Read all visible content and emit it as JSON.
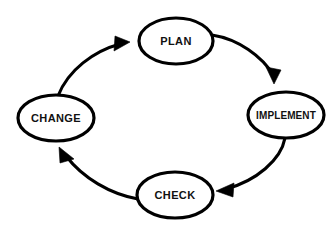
{
  "diagram": {
    "background_color": "#ffffff",
    "stroke_color": "#000000",
    "text_color": "#111111",
    "nodes": [
      {
        "id": "plan",
        "label": "PLAN",
        "icon": "ellipse-node",
        "cx": 176,
        "cy": 41,
        "rx": 37,
        "ry": 23
      },
      {
        "id": "implement",
        "label": "IMPLEMENT",
        "icon": "ellipse-node",
        "cx": 286,
        "cy": 115,
        "rx": 38,
        "ry": 23
      },
      {
        "id": "check",
        "label": "CHECK",
        "icon": "ellipse-node",
        "cx": 175,
        "cy": 195,
        "rx": 38,
        "ry": 23
      },
      {
        "id": "change",
        "label": "CHANGE",
        "icon": "ellipse-node",
        "cx": 56,
        "cy": 118,
        "rx": 38,
        "ry": 23
      }
    ],
    "edges": [
      {
        "id": "plan-to-implement",
        "from": "plan",
        "to": "implement",
        "icon": "curved-arrow-icon",
        "path": "M 212 35 C 238 39 262 56 274 76",
        "arrow_points": "274,84 266,67 281,70"
      },
      {
        "id": "implement-to-check",
        "from": "implement",
        "to": "check",
        "icon": "curved-arrow-icon",
        "path": "M 285 138 C 281 160 256 181 226 189",
        "arrow_points": "216,191 234,183 233,197"
      },
      {
        "id": "check-to-change",
        "from": "check",
        "to": "change",
        "icon": "curved-arrow-icon",
        "path": "M 138 199 C 110 194 83 178 66 156",
        "arrow_points": "59,147 74,159 60,163"
      },
      {
        "id": "change-to-plan",
        "from": "change",
        "to": "plan",
        "icon": "curved-arrow-icon",
        "path": "M 58 96 C 68 70 94 51 120 44",
        "arrow_points": "130,42 114,51 115,36"
      }
    ]
  }
}
